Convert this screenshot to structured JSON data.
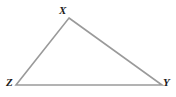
{
  "figure": {
    "kind": "geometry-diagram",
    "shape": "triangle",
    "canvas": {
      "width": 176,
      "height": 97
    },
    "background_color": "#ffffff",
    "stroke_color": "#9a9a9a",
    "stroke_width": 1.6,
    "fill_color": "none",
    "label_color": "#1b1b1b",
    "vertices": [
      {
        "name": "X",
        "label": "X",
        "x": 69,
        "y": 18,
        "label_x": 63,
        "label_y": 11,
        "label_position": "above"
      },
      {
        "name": "Z",
        "label": "Z",
        "x": 16,
        "y": 85,
        "label_x": 11,
        "label_y": 83,
        "label_position": "left"
      },
      {
        "name": "Y",
        "label": "Y",
        "x": 162,
        "y": 85,
        "label_x": 168,
        "label_y": 83,
        "label_position": "right"
      }
    ],
    "edges": [
      {
        "name": "ZX",
        "from": "Z",
        "to": "X"
      },
      {
        "name": "XY",
        "from": "X",
        "to": "Y"
      },
      {
        "name": "YZ",
        "from": "Y",
        "to": "Z"
      }
    ],
    "points_path": "69,18 162,85 16,85"
  }
}
